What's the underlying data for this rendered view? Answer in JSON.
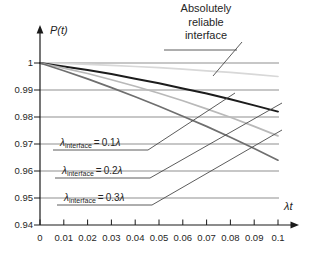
{
  "figure": {
    "background": "#ffffff",
    "text_color": "#262626",
    "grid_color": "#8f8f8f",
    "axis_color": "#1a1a1a",
    "leader_color": "#4a4a4a",
    "y_axis_label": "P(t)",
    "x_axis_label": "λt",
    "title_callout_lines": [
      "Absolutely",
      "reliable",
      "interface"
    ],
    "callouts": [
      {
        "lambda": "λ",
        "subscript": "interface",
        "equals": "=",
        "factor": "0.1",
        "lambda2": "λ"
      },
      {
        "lambda": "λ",
        "subscript": "interface",
        "equals": "=",
        "factor": "0.2",
        "lambda2": "λ"
      },
      {
        "lambda": "λ",
        "subscript": "interface",
        "equals": "=",
        "factor": "0.3",
        "lambda2": "λ"
      }
    ]
  },
  "chart_data": {
    "type": "line",
    "title": "",
    "xlabel": "λt",
    "ylabel": "P(t)",
    "xlim": [
      0,
      0.1
    ],
    "ylim": [
      0.94,
      1.0
    ],
    "grid": true,
    "legend_position": "annotated-callouts",
    "x": [
      0,
      0.01,
      0.02,
      0.03,
      0.04,
      0.05,
      0.06,
      0.07,
      0.08,
      0.09,
      0.1
    ],
    "x_tick_labels": [
      "0",
      "0.01",
      "0.02",
      "0.03",
      "0.04",
      "0.05",
      "0.06",
      "0.07",
      "0.08",
      "0.09",
      "0.1"
    ],
    "y_ticks": [
      1,
      0.99,
      0.98,
      0.97,
      0.96,
      0.95,
      0.94
    ],
    "y_tick_labels": [
      "1",
      "0.99",
      "0.98",
      "0.97",
      "0.96",
      "0.95",
      "0.94"
    ],
    "series": [
      {
        "name": "Absolutely reliable interface",
        "color": "#d8d8d8",
        "width": 1.7,
        "values": [
          1,
          0.9998,
          0.9995,
          0.9991,
          0.9987,
          0.9983,
          0.9977,
          0.9971,
          0.9965,
          0.9958,
          0.995
        ]
      },
      {
        "name": "λinterface = 0.1λ",
        "color": "#1c1c1c",
        "width": 2,
        "values": [
          1,
          0.9987,
          0.9974,
          0.9959,
          0.9942,
          0.9925,
          0.9906,
          0.9887,
          0.9866,
          0.9843,
          0.982
        ]
      },
      {
        "name": "λinterface = 0.2λ",
        "color": "#b9b9b9",
        "width": 1.7,
        "values": [
          1,
          0.9981,
          0.9961,
          0.9938,
          0.9914,
          0.9888,
          0.986,
          0.983,
          0.9799,
          0.9765,
          0.973
        ]
      },
      {
        "name": "λinterface = 0.3λ",
        "color": "#6f6f6f",
        "width": 1.7,
        "values": [
          1,
          0.9971,
          0.9941,
          0.9909,
          0.9875,
          0.984,
          0.9803,
          0.9765,
          0.9725,
          0.9683,
          0.964
        ]
      }
    ]
  }
}
